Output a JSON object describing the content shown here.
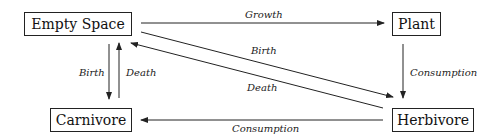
{
  "diagram": {
    "type": "flow",
    "nodes": [
      {
        "id": "empty_space",
        "label": "Empty Space"
      },
      {
        "id": "plant",
        "label": "Plant"
      },
      {
        "id": "carnivore",
        "label": "Carnivore"
      },
      {
        "id": "herbivore",
        "label": "Herbivore"
      }
    ],
    "edges": [
      {
        "from": "empty_space",
        "to": "plant",
        "label": "Growth"
      },
      {
        "from": "plant",
        "to": "herbivore",
        "label": "Consumption"
      },
      {
        "from": "herbivore",
        "to": "carnivore",
        "label": "Consumption"
      },
      {
        "from": "empty_space",
        "to": "carnivore",
        "label": "Birth"
      },
      {
        "from": "carnivore",
        "to": "empty_space",
        "label": "Death"
      },
      {
        "from": "empty_space",
        "to": "herbivore",
        "label": "Birth"
      },
      {
        "from": "herbivore",
        "to": "empty_space",
        "label": "Death"
      }
    ]
  },
  "colors": {
    "line": "#222222",
    "background": "#ffffff"
  }
}
